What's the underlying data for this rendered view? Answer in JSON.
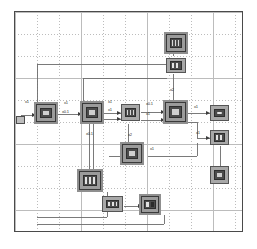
{
  "editor": {
    "title": "Signal Flow Diagram Canvas",
    "canvas_name": "block-diagram-canvas",
    "grid_spacing_px": 22,
    "grid_visible": true,
    "border_color": "#4a4a4a",
    "grid_color": "#b9b9b9",
    "node_fill": "#a8a8a8",
    "node_stroke": "#555555",
    "wire_color": "#6b6b6b",
    "label_color": "#2f2f2f"
  },
  "nodes": [
    {
      "id": "n1",
      "name": "node-top-upper",
      "x": 166,
      "y": 34,
      "w": 20,
      "h": 18,
      "glyph": "g-bars",
      "selected": true,
      "label": ""
    },
    {
      "id": "n2",
      "name": "node-top-lower",
      "x": 166,
      "y": 58,
      "w": 20,
      "h": 15,
      "glyph": "g-wide",
      "selected": false,
      "label": ""
    },
    {
      "id": "n3",
      "name": "node-input-left",
      "x": 36,
      "y": 104,
      "w": 20,
      "h": 18,
      "glyph": "g-box",
      "selected": true,
      "label": ""
    },
    {
      "id": "n4",
      "name": "node-stage-two",
      "x": 82,
      "y": 103,
      "w": 20,
      "h": 19,
      "glyph": "g-box",
      "selected": true,
      "label": ""
    },
    {
      "id": "n5",
      "name": "node-stage-three",
      "x": 121,
      "y": 104,
      "w": 19,
      "h": 17,
      "glyph": "g-bars",
      "selected": false,
      "label": ""
    },
    {
      "id": "n6",
      "name": "node-stage-four",
      "x": 165,
      "y": 102,
      "w": 21,
      "h": 20,
      "glyph": "g-box",
      "selected": true,
      "label": ""
    },
    {
      "id": "n7",
      "name": "node-output-upper",
      "x": 210,
      "y": 105,
      "w": 19,
      "h": 16,
      "glyph": "g-dot",
      "selected": false,
      "label": ""
    },
    {
      "id": "n8",
      "name": "node-output-mid",
      "x": 210,
      "y": 130,
      "w": 19,
      "h": 15,
      "glyph": "g-wide",
      "selected": false,
      "label": ""
    },
    {
      "id": "n9",
      "name": "node-output-lower",
      "x": 210,
      "y": 166,
      "w": 19,
      "h": 18,
      "glyph": "g-box",
      "selected": false,
      "label": ""
    },
    {
      "id": "n10",
      "name": "node-branch-mid",
      "x": 122,
      "y": 144,
      "w": 20,
      "h": 19,
      "glyph": "g-box",
      "selected": true,
      "label": ""
    },
    {
      "id": "n11",
      "name": "node-lower-left",
      "x": 79,
      "y": 171,
      "w": 22,
      "h": 19,
      "glyph": "g-wide",
      "selected": true,
      "label": ""
    },
    {
      "id": "n12",
      "name": "node-bottom-left",
      "x": 102,
      "y": 196,
      "w": 21,
      "h": 16,
      "glyph": "g-wide",
      "selected": false,
      "label": ""
    },
    {
      "id": "n13",
      "name": "node-bottom-right",
      "x": 141,
      "y": 196,
      "w": 18,
      "h": 17,
      "glyph": "g-split",
      "selected": true,
      "label": ""
    }
  ],
  "gain_labels": [
    {
      "name": "gain-input",
      "text": "x1",
      "x": 25,
      "y": 100
    },
    {
      "name": "gain-n3-n4",
      "text": "x1",
      "x": 64,
      "y": 101
    },
    {
      "name": "gain-n3-n4-alt",
      "text": "x0.1",
      "x": 62,
      "y": 110
    },
    {
      "name": "gain-n4-n5",
      "text": "x1",
      "x": 108,
      "y": 100
    },
    {
      "name": "gain-n4-n5-alt",
      "text": "x1",
      "x": 108,
      "y": 108
    },
    {
      "name": "gain-n5-n6",
      "text": "x0.1",
      "x": 146,
      "y": 102
    },
    {
      "name": "gain-n5-n6-alt",
      "text": "x1",
      "x": 146,
      "y": 112
    },
    {
      "name": "gain-n6-n7",
      "text": "x1",
      "x": 194,
      "y": 105
    },
    {
      "name": "gain-n6-n8",
      "text": "x1",
      "x": 196,
      "y": 131
    },
    {
      "name": "gain-n2-n6",
      "text": "x2",
      "x": 170,
      "y": 88
    },
    {
      "name": "gain-n4-down",
      "text": "x0.1",
      "x": 86,
      "y": 132
    },
    {
      "name": "gain-n5-down",
      "text": "x2",
      "x": 128,
      "y": 133
    },
    {
      "name": "gain-n10-right",
      "text": "x1",
      "x": 150,
      "y": 147
    }
  ],
  "stub": {
    "name": "feedback-stub",
    "x": 16,
    "y": 116
  },
  "wires": [
    {
      "name": "wire-input-to-n3",
      "from": "canvas-left",
      "to": "n3"
    },
    {
      "name": "wire-n3-to-n4",
      "from": "n3",
      "to": "n4"
    },
    {
      "name": "wire-n4-to-n5",
      "from": "n4",
      "to": "n5"
    },
    {
      "name": "wire-n5-to-n6",
      "from": "n5",
      "to": "n6"
    },
    {
      "name": "wire-n6-to-n7",
      "from": "n6",
      "to": "n7"
    },
    {
      "name": "wire-n6-to-n8",
      "from": "n6",
      "to": "n8"
    },
    {
      "name": "wire-n8-to-n9",
      "from": "n8",
      "to": "n9"
    },
    {
      "name": "wire-n2-to-n6",
      "from": "n2",
      "to": "n6"
    },
    {
      "name": "wire-n1-to-n2",
      "from": "n1",
      "to": "n2"
    },
    {
      "name": "wire-n2-feedback-left",
      "from": "n2",
      "to": "n3"
    },
    {
      "name": "wire-n5-to-n10",
      "from": "n5",
      "to": "n10"
    },
    {
      "name": "wire-n10-to-right-bus",
      "from": "n10",
      "to": "n8"
    },
    {
      "name": "wire-n4-to-n11",
      "from": "n4",
      "to": "n11"
    },
    {
      "name": "wire-n12-to-n13",
      "from": "n12",
      "to": "n13"
    },
    {
      "name": "wire-bottom-feedback",
      "from": "n13",
      "to": "n3"
    }
  ]
}
